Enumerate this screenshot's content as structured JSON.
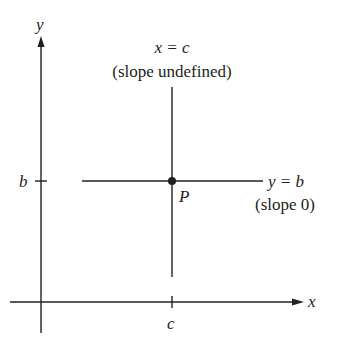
{
  "diagram": {
    "axes": {
      "x_label": "x",
      "y_label": "y",
      "color": "#231f20"
    },
    "ticks": {
      "y_tick_label": "b",
      "x_tick_label": "c"
    },
    "vertical_line": {
      "equation": "x = c",
      "note": "(slope undefined)"
    },
    "horizontal_line": {
      "equation": "y = b",
      "note": "(slope 0)"
    },
    "point": {
      "label": "P"
    }
  }
}
